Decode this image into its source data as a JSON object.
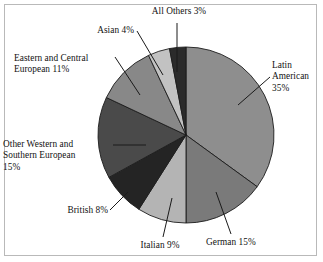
{
  "chart_data": {
    "type": "pie",
    "title": "",
    "subtitle": "",
    "xlabel": "",
    "ylabel": "",
    "legend_position": "none",
    "grid": false,
    "start_angle_deg": 0,
    "direction": "clockwise",
    "categories": [
      "Latin American",
      "German",
      "Italian",
      "British",
      "Other Western and Southern European",
      "Eastern and Central European",
      "Asian",
      "All Others"
    ],
    "values": [
      35,
      15,
      9,
      8,
      15,
      11,
      4,
      3
    ],
    "value_unit": "%",
    "slices": [
      {
        "label": "Latin American",
        "value": 35,
        "display_text": "Latin\nAmerican\n35%",
        "color": "#8e8e8e"
      },
      {
        "label": "German",
        "value": 15,
        "display_text": "German 15%",
        "color": "#7a7a7a"
      },
      {
        "label": "Italian",
        "value": 9,
        "display_text": "Italian 9%",
        "color": "#b4b4b4"
      },
      {
        "label": "British",
        "value": 8,
        "display_text": "British 8%",
        "color": "#242424"
      },
      {
        "label": "Other Western and Southern European",
        "value": 15,
        "display_text": "Other Western and\nSouthern European\n15%",
        "color": "#4a4a4a"
      },
      {
        "label": "Eastern and Central European",
        "value": 11,
        "display_text": "Eastern and Central\nEuropean 11%",
        "color": "#888888"
      },
      {
        "label": "Asian",
        "value": 4,
        "display_text": "Asian 4%",
        "color": "#c2c2c2"
      },
      {
        "label": "All Others",
        "value": 3,
        "display_text": "All Others 3%",
        "color": "#2b2b2b"
      }
    ]
  },
  "figure": {
    "border_color": "#b9b9b9",
    "background": "#ffffff",
    "outline_color": "#1c1c1c"
  }
}
